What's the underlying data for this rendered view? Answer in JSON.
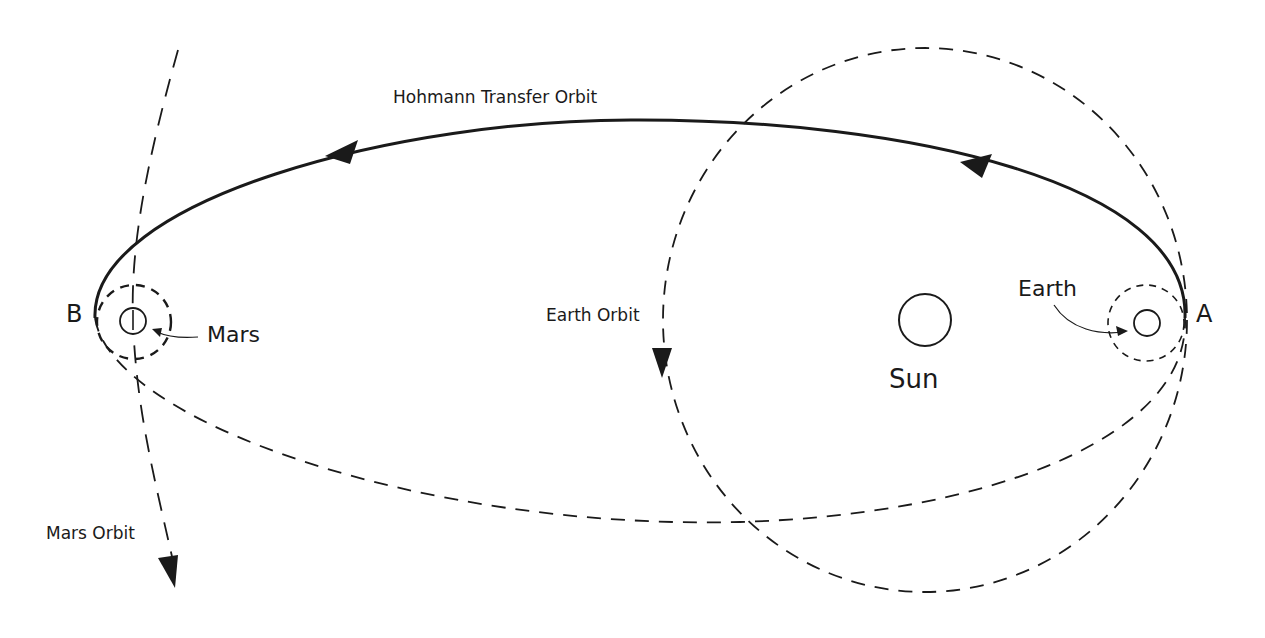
{
  "diagram": {
    "title": "Hohmann Transfer Orbit",
    "labels": {
      "transfer_orbit": "Hohmann Transfer Orbit",
      "earth_orbit": "Earth Orbit",
      "mars_orbit": "Mars Orbit",
      "sun": "Sun",
      "earth": "Earth",
      "mars": "Mars",
      "point_a": "A",
      "point_b": "B"
    },
    "colors": {
      "line": "#1a1a1a",
      "background": "#ffffff"
    }
  }
}
